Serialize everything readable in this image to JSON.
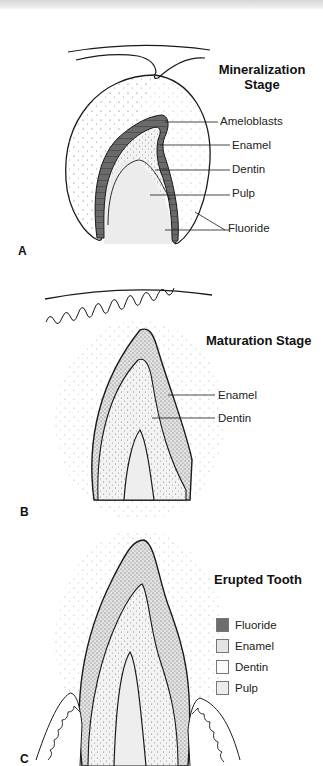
{
  "panels": [
    {
      "letter": "A",
      "title_line1": "Mineralization",
      "title_line2": "Stage",
      "labels": [
        "Ameloblasts",
        "Enamel",
        "Dentin",
        "Pulp",
        "Fluoride"
      ]
    },
    {
      "letter": "B",
      "title": "Maturation Stage",
      "labels": [
        "Enamel",
        "Dentin"
      ]
    },
    {
      "letter": "C",
      "title": "Erupted Tooth"
    }
  ],
  "legend": [
    {
      "label": "Fluoride",
      "color": "#6e6e6e"
    },
    {
      "label": "Enamel",
      "color": "#e4e4e4"
    },
    {
      "label": "Dentin",
      "color": "#fafafa"
    },
    {
      "label": "Pulp",
      "color": "#ececec"
    }
  ],
  "colors": {
    "outline": "#1a1a1a",
    "ameloblast": "#6e6e6e",
    "pulp": "#ececec",
    "enamel_stipple": "#bdbdbd"
  }
}
